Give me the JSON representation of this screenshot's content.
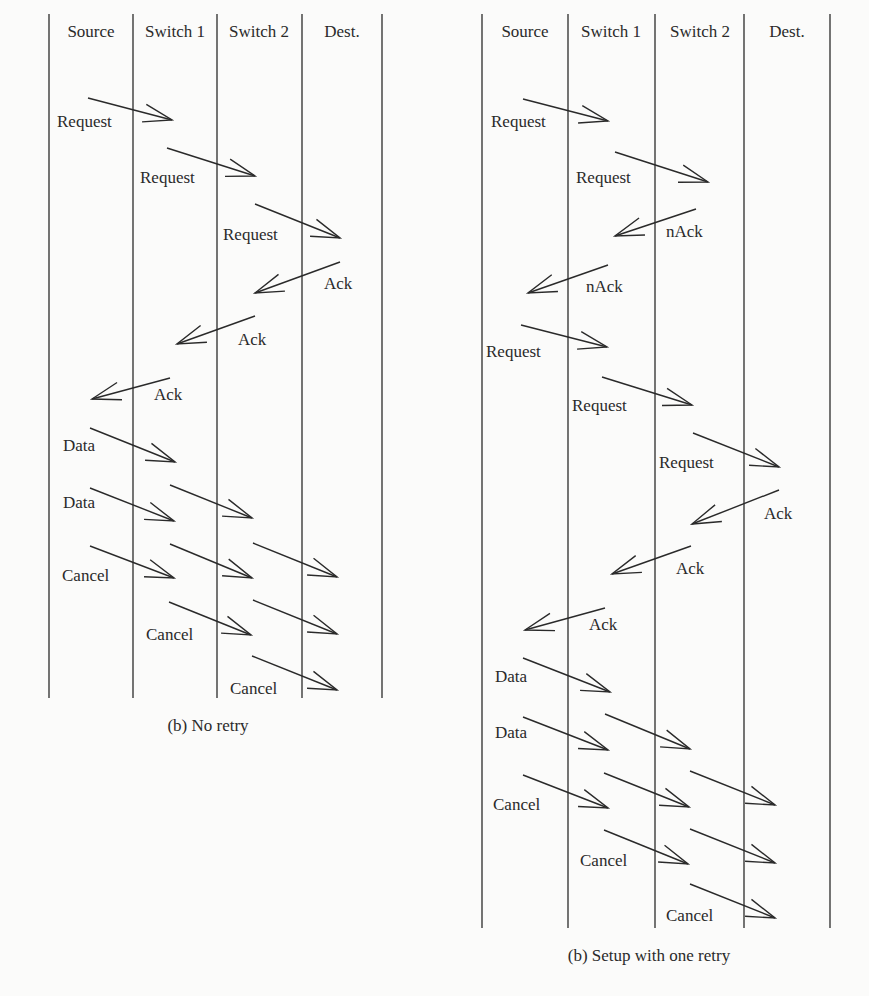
{
  "diagrams": [
    {
      "id": "no-retry",
      "caption": "(b) No retry",
      "caption_pos": [
        208,
        731
      ],
      "lane_x": [
        49,
        133,
        217,
        302,
        382
      ],
      "lane_top": 14,
      "lane_bottom": 698,
      "headers": [
        {
          "label": "Source",
          "x": 91
        },
        {
          "label": "Switch 1",
          "x": 175
        },
        {
          "label": "Switch 2",
          "x": 259
        },
        {
          "label": "Dest.",
          "x": 342
        }
      ],
      "header_y": 37,
      "messages": [
        {
          "label": "Request",
          "from": [
            88,
            98
          ],
          "to": [
            172,
            120
          ],
          "lx": 57,
          "ly": 127
        },
        {
          "label": "Request",
          "from": [
            167,
            148
          ],
          "to": [
            255,
            176
          ],
          "lx": 140,
          "ly": 183
        },
        {
          "label": "Request",
          "from": [
            255,
            204
          ],
          "to": [
            340,
            238
          ],
          "lx": 223,
          "ly": 240
        },
        {
          "label": "Ack",
          "from": [
            340,
            262
          ],
          "to": [
            255,
            293
          ],
          "lx": 324,
          "ly": 289
        },
        {
          "label": "Ack",
          "from": [
            255,
            316
          ],
          "to": [
            177,
            344
          ],
          "lx": 238,
          "ly": 345
        },
        {
          "label": "Ack",
          "from": [
            170,
            378
          ],
          "to": [
            92,
            399
          ],
          "lx": 154,
          "ly": 400
        },
        {
          "label": "Data",
          "from": [
            90,
            428
          ],
          "to": [
            175,
            462
          ],
          "lx": 63,
          "ly": 451
        },
        {
          "label": "Data",
          "from": [
            90,
            488
          ],
          "to": [
            174,
            521
          ],
          "lx": 63,
          "ly": 508
        },
        {
          "label": "",
          "from": [
            170,
            485
          ],
          "to": [
            252,
            518
          ],
          "lx": 0,
          "ly": 0
        },
        {
          "label": "Cancel",
          "from": [
            90,
            546
          ],
          "to": [
            174,
            578
          ],
          "lx": 62,
          "ly": 581
        },
        {
          "label": "",
          "from": [
            170,
            544
          ],
          "to": [
            252,
            578
          ],
          "lx": 0,
          "ly": 0
        },
        {
          "label": "",
          "from": [
            253,
            543
          ],
          "to": [
            337,
            577
          ],
          "lx": 0,
          "ly": 0
        },
        {
          "label": "Cancel",
          "from": [
            169,
            602
          ],
          "to": [
            251,
            635
          ],
          "lx": 146,
          "ly": 640
        },
        {
          "label": "",
          "from": [
            253,
            600
          ],
          "to": [
            337,
            634
          ],
          "lx": 0,
          "ly": 0
        },
        {
          "label": "Cancel",
          "from": [
            252,
            656
          ],
          "to": [
            337,
            690
          ],
          "lx": 230,
          "ly": 694
        }
      ]
    },
    {
      "id": "one-retry",
      "caption": "(b) Setup with one retry",
      "caption_pos": [
        649,
        961
      ],
      "lane_x": [
        482,
        568,
        655,
        744,
        830
      ],
      "lane_top": 14,
      "lane_bottom": 928,
      "headers": [
        {
          "label": "Source",
          "x": 525
        },
        {
          "label": "Switch 1",
          "x": 611
        },
        {
          "label": "Switch 2",
          "x": 700
        },
        {
          "label": "Dest.",
          "x": 787
        }
      ],
      "header_y": 37,
      "messages": [
        {
          "label": "Request",
          "from": [
            523,
            99
          ],
          "to": [
            608,
            121
          ],
          "lx": 491,
          "ly": 127
        },
        {
          "label": "Request",
          "from": [
            615,
            152
          ],
          "to": [
            708,
            182
          ],
          "lx": 576,
          "ly": 183
        },
        {
          "label": "nAck",
          "from": [
            696,
            209
          ],
          "to": [
            615,
            236
          ],
          "lx": 666,
          "ly": 237
        },
        {
          "label": "nAck",
          "from": [
            608,
            265
          ],
          "to": [
            528,
            293
          ],
          "lx": 586,
          "ly": 292
        },
        {
          "label": "Request",
          "from": [
            521,
            325
          ],
          "to": [
            607,
            347
          ],
          "lx": 486,
          "ly": 357
        },
        {
          "label": "Request",
          "from": [
            602,
            377
          ],
          "to": [
            692,
            405
          ],
          "lx": 572,
          "ly": 411
        },
        {
          "label": "Request",
          "from": [
            693,
            433
          ],
          "to": [
            779,
            467
          ],
          "lx": 659,
          "ly": 468
        },
        {
          "label": "Ack",
          "from": [
            779,
            490
          ],
          "to": [
            692,
            524
          ],
          "lx": 764,
          "ly": 519
        },
        {
          "label": "Ack",
          "from": [
            691,
            546
          ],
          "to": [
            612,
            574
          ],
          "lx": 676,
          "ly": 574
        },
        {
          "label": "Ack",
          "from": [
            605,
            608
          ],
          "to": [
            525,
            630
          ],
          "lx": 589,
          "ly": 630
        },
        {
          "label": "Data",
          "from": [
            523,
            658
          ],
          "to": [
            610,
            692
          ],
          "lx": 495,
          "ly": 682
        },
        {
          "label": "Data",
          "from": [
            523,
            717
          ],
          "to": [
            608,
            750
          ],
          "lx": 495,
          "ly": 738
        },
        {
          "label": "",
          "from": [
            605,
            714
          ],
          "to": [
            690,
            749
          ],
          "lx": 0,
          "ly": 0
        },
        {
          "label": "Cancel",
          "from": [
            523,
            775
          ],
          "to": [
            608,
            808
          ],
          "lx": 493,
          "ly": 810
        },
        {
          "label": "",
          "from": [
            604,
            773
          ],
          "to": [
            689,
            807
          ],
          "lx": 0,
          "ly": 0
        },
        {
          "label": "",
          "from": [
            690,
            771
          ],
          "to": [
            775,
            805
          ],
          "lx": 0,
          "ly": 0
        },
        {
          "label": "Cancel",
          "from": [
            604,
            830
          ],
          "to": [
            688,
            864
          ],
          "lx": 580,
          "ly": 866
        },
        {
          "label": "",
          "from": [
            690,
            829
          ],
          "to": [
            775,
            863
          ],
          "lx": 0,
          "ly": 0
        },
        {
          "label": "Cancel",
          "from": [
            690,
            884
          ],
          "to": [
            775,
            918
          ],
          "lx": 666,
          "ly": 921
        }
      ]
    }
  ]
}
